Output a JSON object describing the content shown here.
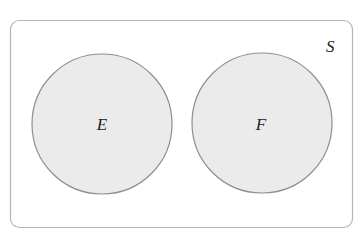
{
  "diagram": {
    "type": "venn",
    "universe": {
      "label": "S"
    },
    "sets": [
      {
        "label": "E"
      },
      {
        "label": "F"
      }
    ],
    "relationship": "disjoint",
    "colors": {
      "border": "#a8a8a8",
      "circle_fill": "#ebebeb",
      "circle_stroke": "#8a8a8a",
      "background": "#ffffff"
    }
  }
}
